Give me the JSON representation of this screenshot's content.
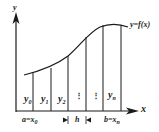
{
  "diagram": {
    "axes": {
      "x_label": "x",
      "y_label": "y"
    },
    "curve_label": "y=f(x)",
    "ordinates": [
      {
        "label": "y",
        "sub": "0"
      },
      {
        "label": "y",
        "sub": "1"
      },
      {
        "label": "y",
        "sub": "2"
      },
      {
        "label": "⋮",
        "sub": ""
      },
      {
        "label": "⋮",
        "sub": ""
      },
      {
        "label": "y",
        "sub": "n"
      }
    ],
    "bottom_labels": {
      "left": {
        "text": "a=x",
        "sub": "0"
      },
      "step": "h",
      "right": {
        "text": "b=x",
        "sub": "n"
      }
    },
    "colors": {
      "stroke": "#1a1a1a",
      "background": "#ffffff"
    }
  }
}
